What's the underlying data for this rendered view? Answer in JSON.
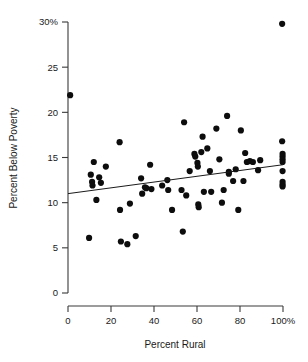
{
  "chart_data": {
    "type": "scatter",
    "title": "",
    "xlabel": "Percent Rural",
    "ylabel": "Percent Below Poverty",
    "xlim": [
      0,
      100
    ],
    "ylim": [
      0,
      30
    ],
    "grid": false,
    "legend": null,
    "xticks": [
      0,
      20,
      40,
      60,
      80,
      100
    ],
    "xtick_labels": [
      "0",
      "20",
      "40",
      "60",
      "80",
      "100%"
    ],
    "yticks": [
      0,
      5,
      10,
      15,
      20,
      25,
      30
    ],
    "ytick_labels": [
      "0",
      "5",
      "10",
      "15",
      "20",
      "25",
      "30%"
    ],
    "marker": "filled-circle",
    "marker_color": "#0d0d0d",
    "marker_size": 3.1,
    "points": [
      {
        "x": 1.0,
        "y": 21.9
      },
      {
        "x": 9.8,
        "y": 6.1
      },
      {
        "x": 10.6,
        "y": 13.1
      },
      {
        "x": 11.2,
        "y": 12.3
      },
      {
        "x": 11.4,
        "y": 11.9
      },
      {
        "x": 12.0,
        "y": 14.5
      },
      {
        "x": 13.2,
        "y": 10.3
      },
      {
        "x": 14.5,
        "y": 12.8
      },
      {
        "x": 15.3,
        "y": 12.2
      },
      {
        "x": 17.6,
        "y": 14.0
      },
      {
        "x": 24.0,
        "y": 16.7
      },
      {
        "x": 24.2,
        "y": 9.2
      },
      {
        "x": 24.6,
        "y": 5.7
      },
      {
        "x": 27.6,
        "y": 5.4
      },
      {
        "x": 28.8,
        "y": 9.9
      },
      {
        "x": 31.5,
        "y": 6.3
      },
      {
        "x": 34.0,
        "y": 12.7
      },
      {
        "x": 34.5,
        "y": 11.0
      },
      {
        "x": 35.8,
        "y": 11.7
      },
      {
        "x": 36.4,
        "y": 11.6
      },
      {
        "x": 38.2,
        "y": 14.2
      },
      {
        "x": 38.8,
        "y": 11.5
      },
      {
        "x": 43.8,
        "y": 11.9
      },
      {
        "x": 46.2,
        "y": 12.5
      },
      {
        "x": 46.6,
        "y": 11.4
      },
      {
        "x": 48.4,
        "y": 9.2
      },
      {
        "x": 52.8,
        "y": 11.4
      },
      {
        "x": 53.4,
        "y": 6.8
      },
      {
        "x": 54.0,
        "y": 18.9
      },
      {
        "x": 55.0,
        "y": 10.8
      },
      {
        "x": 56.6,
        "y": 13.5
      },
      {
        "x": 58.8,
        "y": 15.4
      },
      {
        "x": 59.2,
        "y": 15.1
      },
      {
        "x": 60.2,
        "y": 14.4
      },
      {
        "x": 60.4,
        "y": 14.0
      },
      {
        "x": 60.6,
        "y": 9.8
      },
      {
        "x": 60.8,
        "y": 9.5
      },
      {
        "x": 62.0,
        "y": 15.6
      },
      {
        "x": 62.6,
        "y": 17.3
      },
      {
        "x": 63.2,
        "y": 11.2
      },
      {
        "x": 64.8,
        "y": 16.0
      },
      {
        "x": 66.0,
        "y": 13.5
      },
      {
        "x": 66.6,
        "y": 11.2
      },
      {
        "x": 69.0,
        "y": 18.2
      },
      {
        "x": 70.4,
        "y": 14.8
      },
      {
        "x": 71.6,
        "y": 10.0
      },
      {
        "x": 72.4,
        "y": 11.4
      },
      {
        "x": 74.0,
        "y": 19.6
      },
      {
        "x": 74.8,
        "y": 13.4
      },
      {
        "x": 74.8,
        "y": 13.2
      },
      {
        "x": 76.8,
        "y": 12.4
      },
      {
        "x": 78.0,
        "y": 13.7
      },
      {
        "x": 79.2,
        "y": 9.2
      },
      {
        "x": 80.4,
        "y": 18.0
      },
      {
        "x": 81.6,
        "y": 12.4
      },
      {
        "x": 82.4,
        "y": 15.5
      },
      {
        "x": 83.2,
        "y": 14.5
      },
      {
        "x": 84.6,
        "y": 14.6
      },
      {
        "x": 86.0,
        "y": 14.5
      },
      {
        "x": 88.4,
        "y": 13.6
      },
      {
        "x": 89.4,
        "y": 14.7
      },
      {
        "x": 99.6,
        "y": 29.8
      },
      {
        "x": 99.6,
        "y": 16.8
      },
      {
        "x": 99.8,
        "y": 15.4
      },
      {
        "x": 99.8,
        "y": 15.1
      },
      {
        "x": 99.8,
        "y": 14.8
      },
      {
        "x": 99.8,
        "y": 14.5
      },
      {
        "x": 99.8,
        "y": 13.5
      },
      {
        "x": 99.8,
        "y": 12.3
      },
      {
        "x": 99.8,
        "y": 12.0
      },
      {
        "x": 99.8,
        "y": 11.8
      }
    ],
    "fit_line": {
      "name": "least-squares regression line",
      "x_start": 0,
      "y_start": 11.0,
      "x_end": 100,
      "y_end": 14.2
    }
  }
}
